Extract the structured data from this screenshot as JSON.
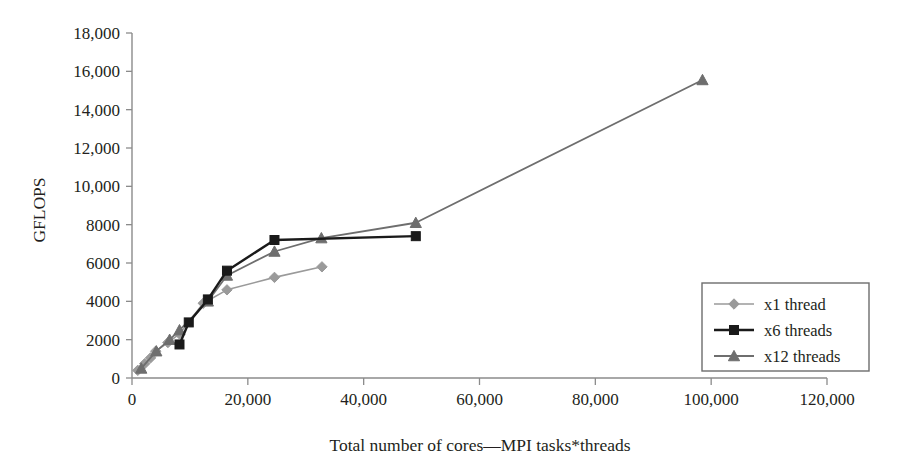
{
  "chart_data": {
    "type": "line",
    "title": "",
    "xlabel": "Total number of cores—MPI tasks*threads",
    "ylabel": "GFLOPS",
    "xlim": [
      0,
      120000
    ],
    "ylim": [
      0,
      18000
    ],
    "xticks": [
      0,
      20000,
      40000,
      60000,
      80000,
      100000,
      120000
    ],
    "xtick_labels": [
      "0",
      "20,000",
      "40,000",
      "60,000",
      "80,000",
      "100,000",
      "120,000"
    ],
    "yticks": [
      0,
      2000,
      4000,
      6000,
      8000,
      10000,
      12000,
      14000,
      16000,
      18000
    ],
    "ytick_labels": [
      "0",
      "2000",
      "4000",
      "6000",
      "8000",
      "10,000",
      "12,000",
      "14,000",
      "16,000",
      "18,000"
    ],
    "grid": false,
    "legend_position": "right-lower",
    "series": [
      {
        "name": "x1 thread",
        "color": "#9a9a9a",
        "marker": "diamond",
        "line_width": 1.6,
        "points": [
          [
            1000,
            400
          ],
          [
            2200,
            750
          ],
          [
            3200,
            1050
          ],
          [
            4100,
            1400
          ],
          [
            6200,
            1850
          ],
          [
            8200,
            2300
          ],
          [
            12300,
            3900
          ],
          [
            16400,
            4600
          ],
          [
            24600,
            5250
          ],
          [
            32800,
            5800
          ]
        ]
      },
      {
        "name": "x6 threads",
        "color": "#1a1a1a",
        "marker": "square",
        "line_width": 2.4,
        "points": [
          [
            8200,
            1750
          ],
          [
            9800,
            2900
          ],
          [
            13100,
            4100
          ],
          [
            16400,
            5600
          ],
          [
            24600,
            7200
          ],
          [
            49000,
            7400
          ]
        ]
      },
      {
        "name": "x12 threads",
        "color": "#6e6e6e",
        "marker": "triangle",
        "line_width": 1.8,
        "points": [
          [
            1600,
            500
          ],
          [
            4200,
            1400
          ],
          [
            6500,
            2000
          ],
          [
            8200,
            2500
          ],
          [
            13100,
            4000
          ],
          [
            16400,
            5350
          ],
          [
            24600,
            6600
          ],
          [
            32700,
            7300
          ],
          [
            49000,
            8100
          ],
          [
            98500,
            15550
          ]
        ]
      }
    ]
  },
  "legend": {
    "entries": [
      {
        "label": "x1 thread"
      },
      {
        "label": "x6 threads"
      },
      {
        "label": "x12 threads"
      }
    ]
  },
  "axes": {
    "y_title": "GFLOPS",
    "x_title": "Total number of cores—MPI tasks*threads"
  },
  "colors": {
    "x1": "#9a9a9a",
    "x6": "#1a1a1a",
    "x12": "#6e6e6e",
    "axis": "#8b8b8b",
    "text": "#231f20",
    "background": "#ffffff"
  }
}
